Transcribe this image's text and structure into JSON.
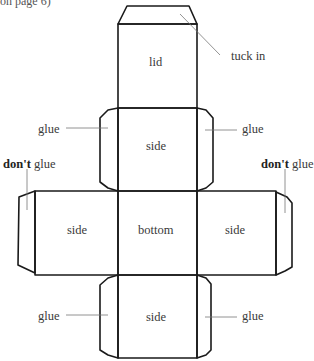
{
  "caption_fragment": "on page 6)",
  "faces": {
    "lid": "lid",
    "side_top": "side",
    "side_left": "side",
    "bottom": "bottom",
    "side_right": "side",
    "side_bottom": "side"
  },
  "labels": {
    "tuck_in": "tuck in",
    "glue_upper_left": "glue",
    "glue_upper_right": "glue",
    "dont_left_bold": "don't",
    "dont_left_rest": " glue",
    "dont_right_bold": "don't",
    "dont_right_rest": " glue",
    "glue_lower_left": "glue",
    "glue_lower_right": "glue"
  }
}
